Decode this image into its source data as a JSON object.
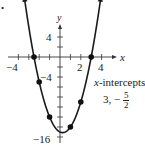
{
  "bullet": "•",
  "axes": {
    "x_label": "x",
    "y_label": "y",
    "x_tick_labels": [
      {
        "value": -4,
        "text": "−4"
      },
      {
        "value": 2,
        "text": "2"
      },
      {
        "value": 4,
        "text": "4"
      }
    ],
    "y_tick_labels": [
      {
        "value": 4,
        "text": "4"
      },
      {
        "value": -4,
        "text": "−4"
      },
      {
        "value": -16,
        "text": "−16"
      }
    ]
  },
  "annotation": {
    "title_var": "x",
    "title_rest": "-intercepts",
    "values_prefix": "3, −",
    "frac_num": "5",
    "frac_den": "2"
  },
  "colors": {
    "curve": "#1a1a1a",
    "axis": "#333333",
    "point": "#111111"
  },
  "chart_data": {
    "type": "line",
    "title": "",
    "function": "y = 2x^2 - x - 15",
    "xlabel": "x",
    "ylabel": "y",
    "xlim": [
      -4.5,
      5
    ],
    "ylim": [
      -16.5,
      6
    ],
    "x_ticks": [
      -4,
      -3,
      -2,
      -1,
      1,
      2,
      3,
      4
    ],
    "y_ticks": [
      4,
      2,
      -2,
      -4,
      -6,
      -8,
      -10,
      -12,
      -14,
      -16
    ],
    "x_tick_labels": [
      -4,
      2,
      4
    ],
    "y_tick_labels": [
      4,
      -4,
      -16
    ],
    "points": [
      {
        "x": -2.5,
        "y": 0
      },
      {
        "x": -2,
        "y": -5
      },
      {
        "x": -1,
        "y": -12
      },
      {
        "x": 1,
        "y": -14
      },
      {
        "x": 2,
        "y": -9
      },
      {
        "x": 3,
        "y": 0
      }
    ],
    "vertex": {
      "x": 0.25,
      "y": -15.125
    },
    "annotations": [
      "x-intercepts",
      "3, -5/2"
    ],
    "grid": false,
    "legend": "none"
  }
}
